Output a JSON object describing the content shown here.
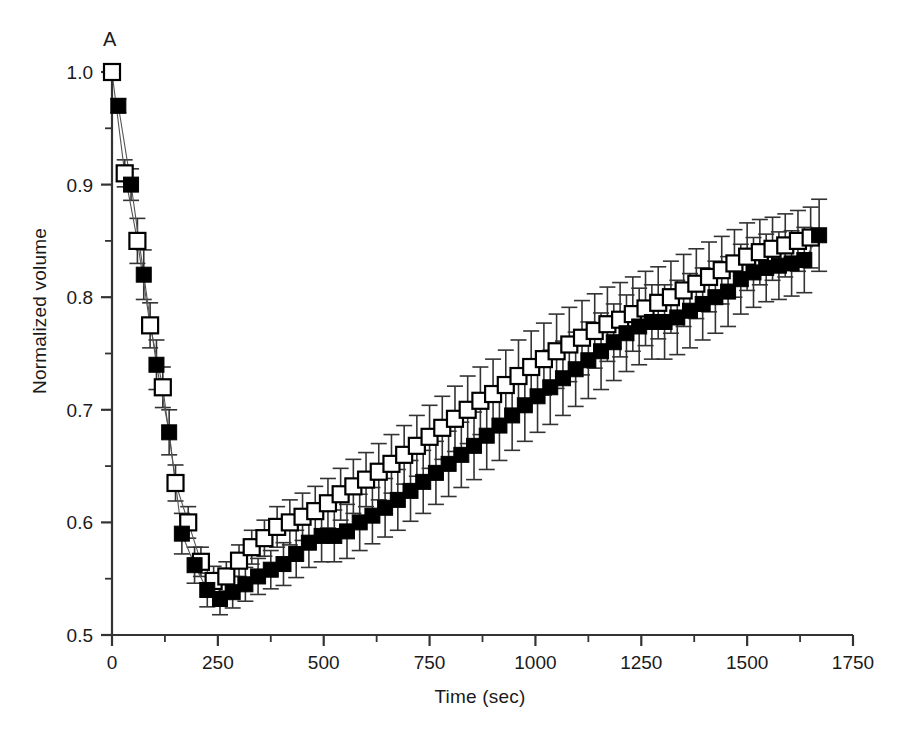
{
  "figure": {
    "panel_label": "A",
    "xlabel": "Time (sec)",
    "ylabel": "Normalized volume"
  },
  "chart_data": {
    "type": "scatter",
    "title": "",
    "subtitle": "",
    "panel": "A",
    "xlabel": "Time (sec)",
    "ylabel": "Normalized volume",
    "xlim": [
      0,
      1750
    ],
    "ylim": [
      0.5,
      1.0
    ],
    "xticks": [
      0,
      250,
      500,
      750,
      1000,
      1250,
      1500,
      1750
    ],
    "xtick_labels": [
      "0",
      "250",
      "500",
      "750",
      "1000",
      "1250",
      "1500",
      "1750"
    ],
    "x_minor_tick_interval": 125,
    "yticks": [
      0.5,
      0.6,
      0.7,
      0.8,
      0.9,
      1.0
    ],
    "ytick_labels": [
      "0.5",
      "0.6",
      "0.7",
      "0.8",
      "0.9",
      "1.0"
    ],
    "y_minor_tick_interval": 0.05,
    "grid": false,
    "legend": "none",
    "error_bars": "vertical, symmetric, with caps",
    "marker_colors": {
      "open_square_edge": "#000000",
      "open_square_fill": "#ffffff",
      "filled_square": "#000000",
      "error_bar": "#333333",
      "axis": "#333333"
    },
    "series": [
      {
        "name": "open squares",
        "marker": "open-square",
        "x": [
          0,
          30,
          60,
          90,
          120,
          150,
          180,
          210,
          240,
          270,
          300,
          330,
          360,
          390,
          420,
          450,
          480,
          510,
          540,
          570,
          600,
          630,
          660,
          690,
          720,
          750,
          780,
          810,
          840,
          870,
          900,
          930,
          960,
          990,
          1020,
          1050,
          1080,
          1110,
          1140,
          1170,
          1200,
          1230,
          1260,
          1290,
          1320,
          1350,
          1380,
          1410,
          1440,
          1470,
          1500,
          1530,
          1560,
          1590,
          1620,
          1650
        ],
        "y": [
          1.0,
          0.91,
          0.85,
          0.775,
          0.72,
          0.635,
          0.6,
          0.565,
          0.548,
          0.552,
          0.566,
          0.578,
          0.586,
          0.596,
          0.6,
          0.605,
          0.61,
          0.617,
          0.625,
          0.632,
          0.638,
          0.645,
          0.652,
          0.66,
          0.668,
          0.676,
          0.684,
          0.692,
          0.7,
          0.708,
          0.714,
          0.722,
          0.73,
          0.738,
          0.745,
          0.752,
          0.758,
          0.764,
          0.77,
          0.776,
          0.78,
          0.785,
          0.79,
          0.795,
          0.8,
          0.806,
          0.812,
          0.818,
          0.824,
          0.83,
          0.836,
          0.84,
          0.843,
          0.846,
          0.85,
          0.853
        ],
        "yerr": [
          0.004,
          0.012,
          0.02,
          0.02,
          0.018,
          0.016,
          0.014,
          0.013,
          0.013,
          0.013,
          0.014,
          0.015,
          0.016,
          0.018,
          0.02,
          0.021,
          0.022,
          0.022,
          0.023,
          0.024,
          0.024,
          0.025,
          0.026,
          0.026,
          0.027,
          0.028,
          0.028,
          0.029,
          0.03,
          0.03,
          0.031,
          0.031,
          0.032,
          0.032,
          0.032,
          0.033,
          0.033,
          0.033,
          0.033,
          0.033,
          0.033,
          0.033,
          0.033,
          0.032,
          0.032,
          0.032,
          0.031,
          0.031,
          0.03,
          0.03,
          0.03,
          0.029,
          0.028,
          0.028,
          0.027,
          0.027
        ]
      },
      {
        "name": "filled squares",
        "marker": "filled-square",
        "x": [
          15,
          45,
          75,
          105,
          135,
          165,
          195,
          225,
          255,
          285,
          315,
          345,
          375,
          405,
          435,
          465,
          495,
          525,
          555,
          585,
          615,
          645,
          675,
          705,
          735,
          765,
          795,
          825,
          855,
          885,
          915,
          945,
          975,
          1005,
          1035,
          1065,
          1095,
          1125,
          1155,
          1185,
          1215,
          1245,
          1275,
          1305,
          1335,
          1365,
          1395,
          1425,
          1455,
          1485,
          1515,
          1545,
          1575,
          1605,
          1635,
          1670
        ],
        "y": [
          0.97,
          0.9,
          0.82,
          0.74,
          0.68,
          0.59,
          0.562,
          0.54,
          0.532,
          0.538,
          0.545,
          0.552,
          0.558,
          0.563,
          0.572,
          0.582,
          0.588,
          0.588,
          0.592,
          0.6,
          0.606,
          0.613,
          0.62,
          0.628,
          0.636,
          0.644,
          0.652,
          0.66,
          0.668,
          0.677,
          0.686,
          0.695,
          0.704,
          0.712,
          0.72,
          0.728,
          0.736,
          0.744,
          0.752,
          0.76,
          0.768,
          0.774,
          0.778,
          0.778,
          0.782,
          0.788,
          0.794,
          0.8,
          0.805,
          0.816,
          0.822,
          0.826,
          0.828,
          0.83,
          0.833,
          0.855
        ],
        "yerr": [
          0.006,
          0.014,
          0.022,
          0.022,
          0.02,
          0.018,
          0.016,
          0.015,
          0.014,
          0.014,
          0.015,
          0.016,
          0.017,
          0.019,
          0.021,
          0.022,
          0.023,
          0.023,
          0.024,
          0.025,
          0.025,
          0.026,
          0.027,
          0.027,
          0.028,
          0.028,
          0.029,
          0.029,
          0.03,
          0.03,
          0.031,
          0.031,
          0.032,
          0.032,
          0.033,
          0.033,
          0.033,
          0.034,
          0.034,
          0.034,
          0.034,
          0.034,
          0.033,
          0.033,
          0.033,
          0.033,
          0.032,
          0.032,
          0.031,
          0.031,
          0.031,
          0.03,
          0.03,
          0.029,
          0.029,
          0.032
        ]
      }
    ]
  }
}
